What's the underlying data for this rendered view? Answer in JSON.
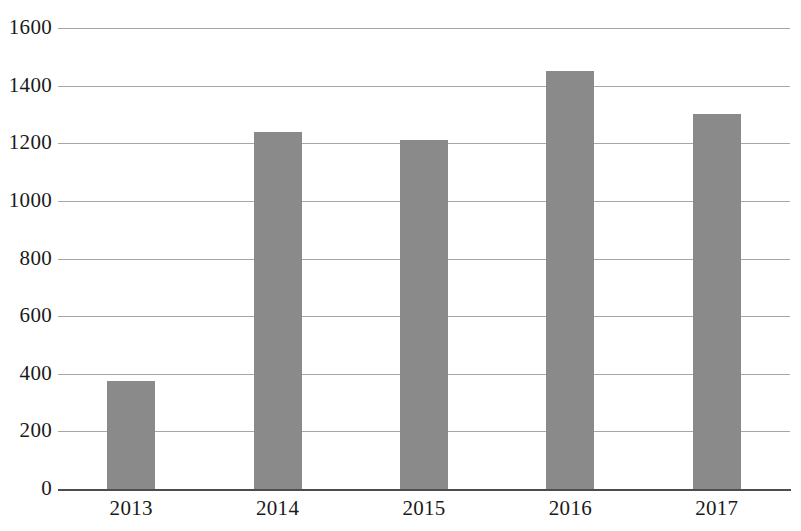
{
  "chart_data": {
    "type": "bar",
    "title": "",
    "subtitle": "",
    "xlabel": "",
    "ylabel": "",
    "categories": [
      "2013",
      "2014",
      "2015",
      "2016",
      "2017"
    ],
    "values": [
      375,
      1240,
      1212,
      1450,
      1302
    ],
    "series": [
      {
        "name": "",
        "values": [
          375,
          1240,
          1212,
          1450,
          1302
        ]
      }
    ],
    "ylim": [
      0,
      1600
    ],
    "ytick_labels": [
      "1600",
      "1400",
      "1200",
      "1000",
      "800",
      "600",
      "400",
      "200",
      "0"
    ],
    "ytick_values": [
      1600,
      1400,
      1200,
      1000,
      800,
      600,
      400,
      200,
      0
    ],
    "ytick_step": 200,
    "grid": true,
    "grid_axis": "y",
    "legend": false,
    "legend_position": "none",
    "bar_color": "#8a8a8a",
    "gridline_color": "#a6a6a6",
    "axis_color": "#4d4d4d",
    "text_color": "#1a1a1a",
    "background": "#ffffff",
    "annotations": []
  }
}
